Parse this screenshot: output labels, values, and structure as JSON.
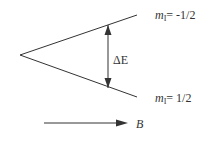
{
  "diagram": {
    "levels": [
      {
        "id": "upper",
        "label_var": "m",
        "label_sub": "I",
        "label_value": "= -1/2"
      },
      {
        "id": "lower",
        "label_var": "m",
        "label_sub": "I",
        "label_value": "= 1/2"
      }
    ],
    "gap_label": "ΔE",
    "field_label": "B",
    "colors": {
      "line": "#333333",
      "text": "#333333",
      "background": "#ffffff"
    }
  }
}
